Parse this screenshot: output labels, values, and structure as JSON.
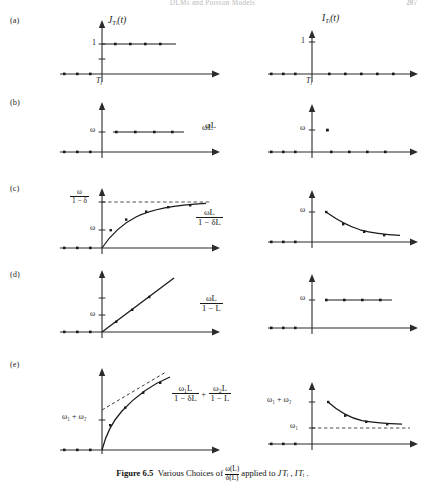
{
  "page": {
    "running_head": "DLMs and Poisson Models",
    "folio": "207"
  },
  "caption": {
    "label": "Figure 6.5",
    "text_before": "Various Choices of",
    "frac_num": "ω(L)",
    "frac_den": "δ(L)",
    "text_after": "applied to",
    "targets": "J Tᵢ , I Tᵢ ."
  },
  "rows": [
    {
      "id": "a",
      "label": "(a)",
      "expression": "",
      "left": {
        "curve_label": "J",
        "curve_label_sub": "T",
        "curve_label_sub2": "i",
        "curve_label_arg": "(t)",
        "y_tick": "1",
        "x_tick": "T",
        "x_tick_sub": "i",
        "kind": "step"
      },
      "right": {
        "curve_label": "I",
        "curve_label_sub": "T",
        "curve_label_sub2": "i",
        "curve_label_arg": "(t)",
        "y_tick": "1",
        "x_tick": "T",
        "x_tick_sub": "i",
        "kind": "pulse"
      }
    },
    {
      "id": "b",
      "label": "(b)",
      "expression": "ωL",
      "left": {
        "y_tick": "ω",
        "kind": "step-omega"
      },
      "right": {
        "y_tick": "ω",
        "kind": "single-spike"
      }
    },
    {
      "id": "c",
      "label": "(c)",
      "expr_num": "ωL",
      "expr_den": "1 − δL",
      "left": {
        "y_tick_top_num": "ω",
        "y_tick_top_den": "1 − δ",
        "y_tick_bottom": "ω",
        "kind": "rise-asymptote"
      },
      "right": {
        "y_tick": "ω",
        "kind": "decay"
      }
    },
    {
      "id": "d",
      "label": "(d)",
      "expr_num": "ωL",
      "expr_den": "1 − L",
      "left": {
        "y_tick": "ω",
        "kind": "ramp"
      },
      "right": {
        "y_tick": "ω",
        "kind": "step-omega"
      }
    },
    {
      "id": "e",
      "label": "(e)",
      "expr_num1": "ω₁L",
      "expr_den1": "1 − δL",
      "expr_plus": "+",
      "expr_num2": "ω₂L",
      "expr_den2": "1 − L",
      "left": {
        "y_tick": "ω₁ + ω₂",
        "kind": "concave-ramp"
      },
      "right": {
        "y_tick_top": "ω₁ + ω₂",
        "y_tick_bottom": "ω₁",
        "kind": "decay-to-level"
      }
    }
  ],
  "style": {
    "ink": "#1a1a1a",
    "axis": "#2b2b2b",
    "dash": "#3a3a3a"
  }
}
